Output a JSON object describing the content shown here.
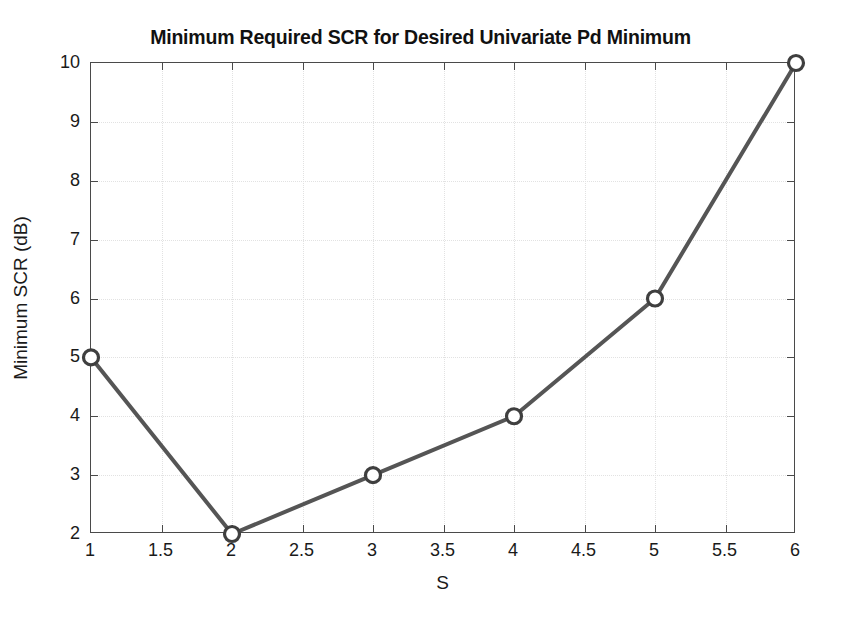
{
  "chart_data": {
    "type": "line",
    "title": "Minimum Required SCR for Desired Univariate Pd Minimum",
    "xlabel": "S",
    "ylabel": "Minimum SCR (dB)",
    "x": [
      1,
      2,
      3,
      4,
      5,
      6
    ],
    "values": [
      5,
      2,
      3,
      4,
      6,
      10
    ],
    "series": [
      {
        "name": "Minimum Required SCR",
        "x": [
          1,
          2,
          3,
          4,
          5,
          6
        ],
        "values": [
          5,
          2,
          3,
          4,
          6,
          10
        ],
        "line_color": "#555555",
        "marker": "circle-open",
        "marker_color": "#3f3f3f"
      }
    ],
    "xlim": [
      1,
      6
    ],
    "ylim": [
      2,
      10
    ],
    "xticks": [
      1,
      1.5,
      2,
      2.5,
      3,
      3.5,
      4,
      4.5,
      5,
      5.5,
      6
    ],
    "xticklabels": [
      "1",
      "1.5",
      "2",
      "2.5",
      "3",
      "3.5",
      "4",
      "4.5",
      "5",
      "5.5",
      "6"
    ],
    "yticks": [
      2,
      3,
      4,
      5,
      6,
      7,
      8,
      9,
      10
    ],
    "yticklabels": [
      "2",
      "3",
      "4",
      "5",
      "6",
      "7",
      "8",
      "9",
      "10"
    ],
    "grid": true,
    "grid_color": "#e2e2e2",
    "legend": null,
    "axis_color": "#4a4a4a",
    "background": "#ffffff"
  }
}
